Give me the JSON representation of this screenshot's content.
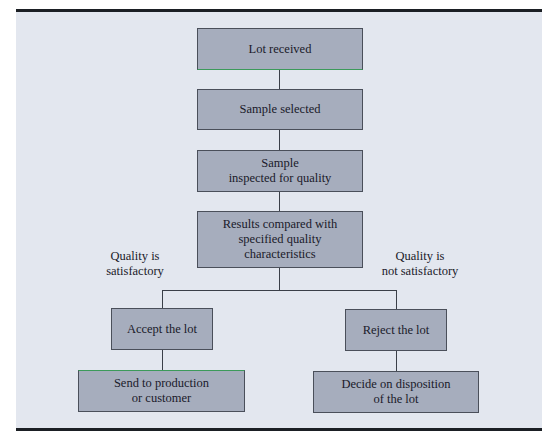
{
  "diagram": {
    "type": "flowchart",
    "nodes": [
      {
        "id": "lot-received",
        "text": "Lot received"
      },
      {
        "id": "sample-selected",
        "text": "Sample selected"
      },
      {
        "id": "sample-inspected",
        "text": "Sample\ninspected for quality"
      },
      {
        "id": "results-compared",
        "text": "Results compared with\nspecified quality\ncharacteristics"
      },
      {
        "id": "accept-lot",
        "text": "Accept the lot"
      },
      {
        "id": "reject-lot",
        "text": "Reject the lot"
      },
      {
        "id": "send-to-production",
        "text": "Send to production\nor customer"
      },
      {
        "id": "decide-disposition",
        "text": "Decide on disposition\nof the lot"
      }
    ],
    "branch_labels": {
      "satisfactory": "Quality is\nsatisfactory",
      "not_satisfactory": "Quality is\nnot satisfactory"
    },
    "edges": [
      [
        "lot-received",
        "sample-selected"
      ],
      [
        "sample-selected",
        "sample-inspected"
      ],
      [
        "sample-inspected",
        "results-compared"
      ],
      [
        "results-compared",
        "accept-lot"
      ],
      [
        "results-compared",
        "reject-lot"
      ],
      [
        "accept-lot",
        "send-to-production"
      ],
      [
        "reject-lot",
        "decide-disposition"
      ]
    ]
  }
}
